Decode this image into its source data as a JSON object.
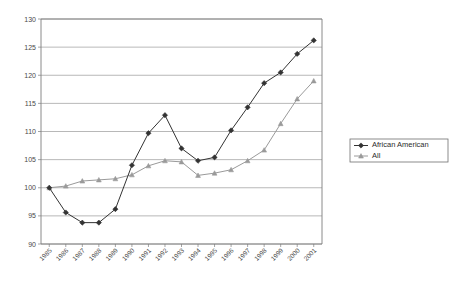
{
  "chart_data": {
    "type": "line",
    "title": "",
    "subtitle": "",
    "xlabel": "",
    "ylabel": "",
    "x": [
      1985,
      1986,
      1987,
      1988,
      1989,
      1990,
      1991,
      1992,
      1993,
      1994,
      1995,
      1996,
      1997,
      1998,
      1999,
      2000,
      2001
    ],
    "categories": [
      "1985",
      "1986",
      "1987",
      "1988",
      "1989",
      "1990",
      "1991",
      "1992",
      "1993",
      "1994",
      "1995",
      "1996",
      "1997",
      "1998",
      "1999",
      "2000",
      "2001"
    ],
    "series": [
      {
        "name": "African American",
        "marker": "filled-diamond",
        "color": "#333333",
        "values": [
          100.0,
          95.6,
          93.8,
          93.8,
          96.2,
          104.0,
          109.7,
          112.9,
          107.0,
          104.8,
          105.4,
          110.2,
          114.3,
          118.6,
          120.5,
          123.8,
          126.2
        ]
      },
      {
        "name": "All",
        "marker": "triangle",
        "color": "#9a9a9a",
        "values": [
          100.0,
          100.3,
          101.2,
          101.4,
          101.6,
          102.3,
          103.9,
          104.8,
          104.6,
          102.2,
          102.6,
          103.2,
          104.8,
          106.7,
          111.4,
          115.8,
          119.0
        ]
      }
    ],
    "ylim": [
      90,
      130
    ],
    "yticks": [
      90,
      95,
      100,
      105,
      110,
      115,
      120,
      125,
      130
    ],
    "ytick_labels": [
      "90",
      "95",
      "100",
      "105",
      "110",
      "115",
      "120",
      "125",
      "130"
    ],
    "grid": true,
    "grid_axis": "y",
    "legend_position": "right",
    "legend": [
      "African American",
      "All"
    ]
  },
  "legend": {
    "items": [
      {
        "label": "African American",
        "marker": "filled-diamond",
        "color": "#333333"
      },
      {
        "label": "All",
        "marker": "triangle",
        "color": "#9a9a9a"
      }
    ]
  },
  "colors": {
    "african_american": "#333333",
    "all": "#9a9a9a",
    "gridline": "#9a9a9a",
    "frame": "#7d7d7d",
    "background": "#ffffff",
    "text": "#4a4a4a"
  }
}
